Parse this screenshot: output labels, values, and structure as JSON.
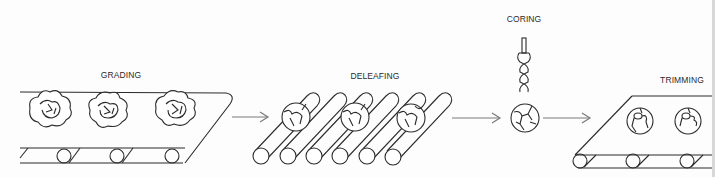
{
  "diagram": {
    "stages": [
      {
        "id": "grading",
        "label": "GRADING"
      },
      {
        "id": "deleafing",
        "label": "DELEAFING"
      },
      {
        "id": "coring",
        "label": "CORING"
      },
      {
        "id": "trimming",
        "label": "TRIMMING"
      }
    ],
    "flow": [
      "GRADING",
      "DELEAFING",
      "CORING",
      "TRIMMING"
    ],
    "colors": {
      "line": "#2b2b2b",
      "arrow": "#7a7a7a",
      "background": "#fdfdfd"
    }
  }
}
